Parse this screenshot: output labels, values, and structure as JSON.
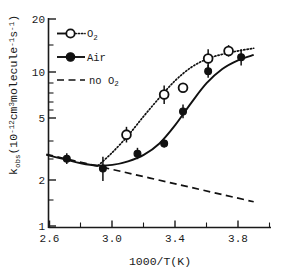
{
  "chart_data": {
    "type": "scatter",
    "title": "",
    "xlabel": "1000/T(K)",
    "ylabel": "k_obs(10-12cm3molecule-1s-1)",
    "ylabel_parts": {
      "k": "k",
      "obs": "obs",
      "open_paren": "(10",
      "exp1": "-12",
      "cm": "cm",
      "exp2": "3",
      "molecule": "molecule",
      "exp3": "-1",
      "s": "s",
      "exp4": "-1",
      "close_paren": ")"
    },
    "yscale": "log",
    "xscale": "linear",
    "xlim": [
      2.56,
      3.98
    ],
    "ylim": [
      1,
      20
    ],
    "grid": false,
    "x_ticks_major": [
      2.6,
      3.0,
      3.4,
      3.8
    ],
    "x_tick_labels": [
      "2.6",
      "3.0",
      "3.4",
      "3.8"
    ],
    "x_ticks_minor": [
      2.8,
      3.2,
      3.6
    ],
    "y_ticks_major": [
      1,
      2,
      5,
      10,
      20
    ],
    "y_tick_labels": [
      "1",
      "2",
      "5",
      "10",
      "20"
    ],
    "y_ticks_minor": [
      3,
      4,
      6,
      7,
      8,
      9,
      15
    ],
    "legend_position": "upper-left",
    "series": [
      {
        "name": "O2",
        "label_base": "O",
        "label_sub": "2",
        "marker": "open-circle",
        "line_style": "dotted",
        "points": [
          {
            "x": 3.09,
            "y": 3.75,
            "yerr_up": 0.45,
            "yerr_down": 0.4
          },
          {
            "x": 3.33,
            "y": 6.7,
            "yerr_up": 0.95,
            "yerr_down": 0.85
          },
          {
            "x": 3.45,
            "y": 7.4,
            "yerr_up": 0.45,
            "yerr_down": 0.4
          },
          {
            "x": 3.61,
            "y": 11.3,
            "yerr_up": 1.6,
            "yerr_down": 1.5
          },
          {
            "x": 3.74,
            "y": 12.6,
            "yerr_up": 1.1,
            "yerr_down": 1.0
          }
        ]
      },
      {
        "name": "Air",
        "label_base": "Air",
        "label_sub": "",
        "marker": "filled-circle",
        "line_style": "solid",
        "points": [
          {
            "x": 2.71,
            "y": 2.65,
            "yerr_up": 0.22,
            "yerr_down": 0.2
          },
          {
            "x": 2.94,
            "y": 2.3,
            "yerr_up": 0.42,
            "yerr_down": 0.38
          },
          {
            "x": 3.16,
            "y": 2.85,
            "yerr_up": 0.25,
            "yerr_down": 0.22
          },
          {
            "x": 3.33,
            "y": 3.3,
            "yerr_up": 0.2,
            "yerr_down": 0.18
          },
          {
            "x": 3.45,
            "y": 5.25,
            "yerr_up": 0.55,
            "yerr_down": 0.5
          },
          {
            "x": 3.61,
            "y": 9.4,
            "yerr_up": 0.9,
            "yerr_down": 0.85
          },
          {
            "x": 3.82,
            "y": 11.5,
            "yerr_up": 1.4,
            "yerr_down": 1.3
          }
        ]
      },
      {
        "name": "no O2",
        "label_base": "no O",
        "label_sub": "2",
        "marker": "none",
        "line_style": "dashed",
        "points": []
      }
    ],
    "fit_curves": [
      {
        "name": "O2-fit",
        "line_style": "dotted",
        "x": [
          2.91,
          3.0,
          3.1,
          3.2,
          3.3,
          3.4,
          3.5,
          3.6,
          3.7,
          3.8,
          3.9
        ],
        "y": [
          2.4,
          2.9,
          3.7,
          4.9,
          6.4,
          8.2,
          9.9,
          11.2,
          12.0,
          12.6,
          13.1
        ]
      },
      {
        "name": "Air-fit",
        "line_style": "solid",
        "x": [
          2.58,
          2.7,
          2.8,
          2.9,
          3.0,
          3.1,
          3.2,
          3.3,
          3.4,
          3.5,
          3.6,
          3.7,
          3.8,
          3.9
        ],
        "y": [
          2.8,
          2.62,
          2.48,
          2.4,
          2.42,
          2.55,
          2.8,
          3.3,
          4.3,
          5.9,
          7.9,
          9.7,
          11.0,
          11.9
        ]
      },
      {
        "name": "no-O2-fit",
        "line_style": "dashed",
        "x": [
          2.58,
          3.9
        ],
        "y": [
          2.82,
          1.42
        ]
      }
    ]
  },
  "legend": {
    "items": [
      {
        "id": "legend-o2",
        "label_base": "O",
        "label_sub": "2",
        "marker": "open-circle",
        "line_style": "dotted"
      },
      {
        "id": "legend-air",
        "label_base": "Air",
        "label_sub": "",
        "marker": "filled-circle",
        "line_style": "solid"
      },
      {
        "id": "legend-no-o2",
        "label_base": "no O",
        "label_sub": "2",
        "marker": "none",
        "line_style": "dashed"
      }
    ]
  }
}
